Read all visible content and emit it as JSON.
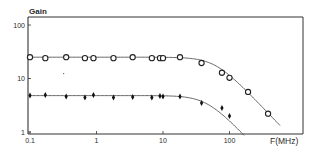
{
  "chart_data": {
    "type": "scatter",
    "title": "",
    "xlabel": "F(MHz)",
    "ylabel": "Gain",
    "x_scale": "log",
    "y_scale": "log",
    "xlim": [
      0.1,
      1000
    ],
    "ylim": [
      1,
      150
    ],
    "x_ticks": [
      "0.1",
      "1",
      "10",
      "100"
    ],
    "y_ticks": [
      "1",
      "10",
      "100"
    ],
    "grid": false,
    "legend": null,
    "series": [
      {
        "name": "high-gain (circles)",
        "marker": "circle",
        "x": [
          0.1,
          0.17,
          0.35,
          0.67,
          0.9,
          1.8,
          3.5,
          6.8,
          9,
          10,
          18,
          38,
          77,
          100,
          190,
          380
        ],
        "y": [
          25,
          24,
          25,
          24,
          24,
          24,
          25,
          24,
          24,
          24,
          25,
          19.5,
          12.8,
          10.3,
          5.6,
          2.2
        ],
        "fit_curve": {
          "plateau": 25,
          "corner_mhz": 60,
          "end_x": 600
        }
      },
      {
        "name": "low-gain (diamonds)",
        "marker": "diamond",
        "x": [
          0.1,
          0.17,
          0.35,
          0.67,
          0.9,
          1.8,
          3.5,
          6.8,
          9,
          10,
          18,
          38,
          77,
          100
        ],
        "y": [
          4.8,
          4.9,
          4.6,
          4.4,
          4.9,
          4.4,
          4.5,
          4.4,
          4.7,
          4.6,
          4.6,
          3.5,
          2.8,
          2.0
        ],
        "fit_curve": {
          "plateau": 4.8,
          "corner_mhz": 45,
          "end_x": 170
        }
      }
    ]
  },
  "labels": {
    "y_axis_title": "Gain",
    "x_axis_title": "F(MHz)"
  }
}
